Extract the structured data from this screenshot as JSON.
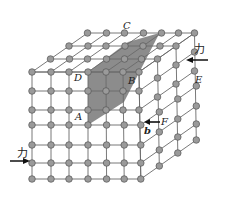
{
  "figure": {
    "labels": {
      "A": "A",
      "B": "B",
      "C": "C",
      "D": "D",
      "E": "E",
      "F": "F",
      "burgers": "b"
    },
    "forces": {
      "right_label": "力",
      "left_label": "力"
    },
    "colors": {
      "node_fill": "#9a9a9a",
      "node_stroke": "#555555",
      "line": "#6a6a6a",
      "slip_plane": "#8c8c8c",
      "background": "#ffffff"
    },
    "lattice": {
      "front_cols": 7,
      "front_rows": 7,
      "depth_layers": 4
    }
  }
}
